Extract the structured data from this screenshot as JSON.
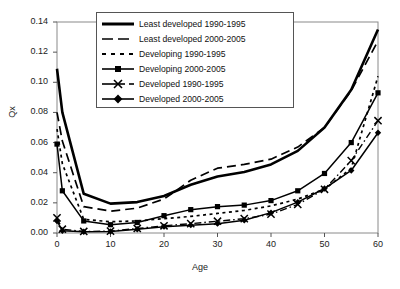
{
  "chart_data": {
    "type": "line",
    "title": "",
    "xlabel": "Age",
    "ylabel": "Qx",
    "xlim": [
      0,
      60
    ],
    "ylim": [
      0,
      0.14
    ],
    "xticks": [
      0,
      10,
      20,
      30,
      40,
      50,
      60
    ],
    "yticks": [
      "0.00",
      "0.02",
      "0.04",
      "0.06",
      "0.08",
      "0.10",
      "0.12",
      "0.14"
    ],
    "ytick_values": [
      0,
      0.02,
      0.04,
      0.06,
      0.08,
      0.1,
      0.12,
      0.14
    ],
    "grid": false,
    "legend_position": "top-center",
    "x": [
      0,
      1,
      5,
      10,
      15,
      20,
      25,
      30,
      35,
      40,
      45,
      50,
      55,
      60
    ],
    "series": [
      {
        "name": "Least developed 1990-1995",
        "style": "solid-thick",
        "marker": "none",
        "color": "#000000",
        "values": [
          0.109,
          0.08,
          0.026,
          0.0195,
          0.0205,
          0.0245,
          0.032,
          0.0375,
          0.0405,
          0.0455,
          0.0545,
          0.07,
          0.095,
          0.135
        ]
      },
      {
        "name": "Least developed 2000-2005",
        "style": "long-dash",
        "marker": "none",
        "color": "#000000",
        "values": [
          0.08,
          0.061,
          0.0175,
          0.0145,
          0.0165,
          0.0225,
          0.035,
          0.043,
          0.0455,
          0.049,
          0.057,
          0.07,
          0.0945,
          0.1275
        ]
      },
      {
        "name": "Developing 1990-1995",
        "style": "short-dash",
        "marker": "none",
        "color": "#000000",
        "values": [
          0.069,
          0.046,
          0.009,
          0.0075,
          0.008,
          0.0095,
          0.011,
          0.013,
          0.015,
          0.018,
          0.0225,
          0.029,
          0.043,
          0.104
        ]
      },
      {
        "name": "Developing 2000-2005",
        "style": "solid-square",
        "marker": "square",
        "color": "#000000",
        "values": [
          0.059,
          0.028,
          0.008,
          0.0055,
          0.007,
          0.0115,
          0.0155,
          0.0175,
          0.0185,
          0.0215,
          0.028,
          0.0395,
          0.06,
          0.093
        ]
      },
      {
        "name": "Developed 1990-1995",
        "style": "dash-dot-x",
        "marker": "x",
        "color": "#000000",
        "values": [
          0.01,
          0.0025,
          0.001,
          0.0012,
          0.003,
          0.0048,
          0.0062,
          0.0078,
          0.0095,
          0.0125,
          0.019,
          0.029,
          0.048,
          0.0745
        ]
      },
      {
        "name": "Developed 2000-2005",
        "style": "solid-diamond",
        "marker": "diamond",
        "color": "#000000",
        "values": [
          0.008,
          0.0015,
          0.0008,
          0.001,
          0.0025,
          0.0042,
          0.0052,
          0.0062,
          0.0085,
          0.0135,
          0.0205,
          0.0295,
          0.0415,
          0.0665
        ]
      }
    ]
  },
  "legend": {
    "items": [
      {
        "label": "Least developed 1990-1995"
      },
      {
        "label": "Least developed 2000-2005"
      },
      {
        "label": "Developing 1990-1995"
      },
      {
        "label": "Developing 2000-2005"
      },
      {
        "label": "Developed 1990-1995"
      },
      {
        "label": "Developed 2000-2005"
      }
    ]
  },
  "axes": {
    "x_title": "Age",
    "y_title": "Qx"
  }
}
